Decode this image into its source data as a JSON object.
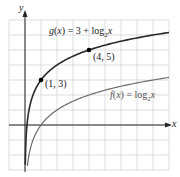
{
  "chart_data": {
    "type": "line",
    "title": "",
    "xlabel": "x",
    "ylabel": "y",
    "xlim": [
      -1,
      9
    ],
    "ylim": [
      -3,
      7
    ],
    "grid": true,
    "legend": "inline labels",
    "series": [
      {
        "name": "g(x) = 3 + log2 x",
        "label_text": "g(x) = 3 + log₂x",
        "color": "#333333",
        "function": "3 + log2(x)",
        "x": [
          0.02,
          0.25,
          0.5,
          1,
          2,
          4,
          6,
          8,
          9
        ],
        "y": [
          -2.64,
          1,
          2,
          3,
          4,
          5,
          5.58,
          6,
          6.17
        ]
      },
      {
        "name": "f(x) = log2 x",
        "label_text": "f(x) = log₂x",
        "color": "#666666",
        "function": "log2(x)",
        "x": [
          0.15,
          0.25,
          0.5,
          1,
          2,
          4,
          6,
          8,
          9
        ],
        "y": [
          -2.74,
          -2,
          -1,
          0,
          1,
          2,
          2.58,
          3,
          3.17
        ]
      }
    ],
    "annotations": [
      {
        "text": "(1, 3)",
        "x": 1,
        "y": 3
      },
      {
        "text": "(4, 5)",
        "x": 4,
        "y": 5
      }
    ]
  },
  "labels": {
    "y_axis": "y",
    "x_axis": "x",
    "g_label": "g(x) = 3 + log",
    "f_label": "f(x) = log",
    "sub2": "2",
    "var_x": "x",
    "point_a": "(1, 3)",
    "point_b": "(4, 5)"
  }
}
